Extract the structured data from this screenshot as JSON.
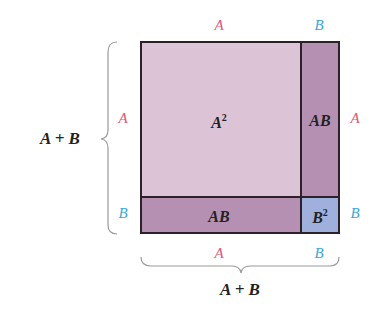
{
  "colors": {
    "a_label": "#e0557a",
    "b_label": "#3aa6d8",
    "a_squared_fill": "#dcc4d6",
    "ab_fill": "#b590b3",
    "b_squared_fill": "#9fb0dc",
    "border": "#2a2228",
    "brace": "#9a9a9a",
    "text": "#222222"
  },
  "top_labels": {
    "a": "A",
    "b": "B"
  },
  "bottom_labels": {
    "a": "A",
    "b": "B"
  },
  "left_labels": {
    "a": "A",
    "b": "B"
  },
  "right_labels": {
    "a": "A",
    "b": "B"
  },
  "left_sum": "A + B",
  "bottom_sum": "A + B",
  "regions": {
    "a_squared": {
      "base": "A",
      "exp": "2"
    },
    "ab_right": "AB",
    "ab_bottom": "AB",
    "b_squared": {
      "base": "B",
      "exp": "2"
    }
  }
}
